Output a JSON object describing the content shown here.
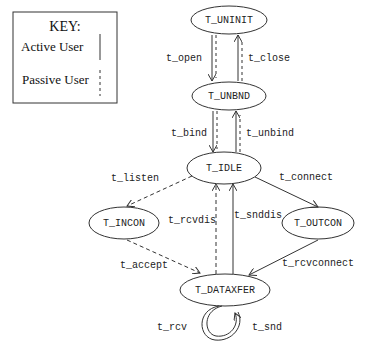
{
  "key": {
    "title": "KEY:",
    "active_label": "Active User",
    "passive_label": "Passive User"
  },
  "states": {
    "uninit": "T_UNINIT",
    "unbnd": "T_UNBND",
    "idle": "T_IDLE",
    "incon": "T_INCON",
    "outcon": "T_OUTCON",
    "dataxfer": "T_DATAXFER"
  },
  "transitions": {
    "open": "t_open",
    "close": "t_close",
    "bind": "t_bind",
    "unbind": "t_unbind",
    "listen": "t_listen",
    "connect": "t_connect",
    "rcvdis": "t_rcvdis",
    "snddis": "t_snddis",
    "accept": "t_accept",
    "rcvconnect": "t_rcvconnect",
    "rcv": "t_rcv",
    "snd": "t_snd"
  },
  "colors": {
    "stroke": "#333333",
    "text": "#222222",
    "background": "#ffffff"
  }
}
